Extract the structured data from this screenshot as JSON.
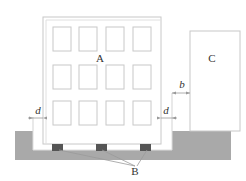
{
  "diagram": {
    "type": "building-separation-schematic",
    "labels": {
      "building_a": "A",
      "building_c": "C",
      "bearings": "B",
      "gap_left": "d",
      "gap_right": "d",
      "separation": "b"
    },
    "building_a": {
      "window_rows": 3,
      "window_cols": 4
    },
    "bearing_count": 3,
    "colors": {
      "outline": "#c8c8c8",
      "ground": "#a9a9a9",
      "bearing": "#555555",
      "leader": "#9a9a9a",
      "text": "#333333"
    }
  }
}
